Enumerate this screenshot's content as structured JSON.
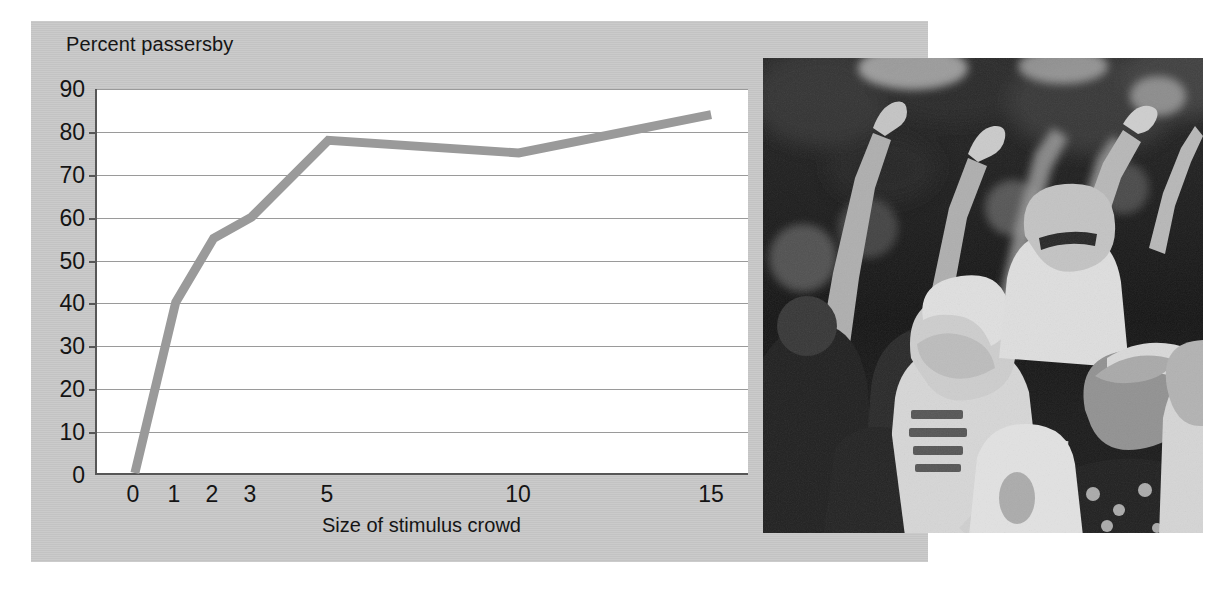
{
  "figure": {
    "panel_color": "#c9c9c9",
    "plot_background": "#ffffff",
    "line_color": "#9a9a9a",
    "axis_color": "#575757",
    "grid_color": "#9a9a9a"
  },
  "chart_data": {
    "type": "line",
    "title": "",
    "xlabel": "Size of stimulus crowd",
    "ylabel": "Percent passersby",
    "categories": [
      "0",
      "1",
      "2",
      "3",
      "5",
      "10",
      "15"
    ],
    "x": [
      0,
      1,
      2,
      3,
      5,
      10,
      15
    ],
    "values": [
      0,
      40,
      55,
      60,
      78,
      75,
      84
    ],
    "series": [
      {
        "name": "Percent passersby",
        "values": [
          0,
          40,
          55,
          60,
          78,
          75,
          84
        ]
      }
    ],
    "xtick_labels": [
      "0",
      "1",
      "2",
      "3",
      "5",
      "10",
      "15"
    ],
    "ytick_labels": [
      "0",
      "10",
      "20",
      "30",
      "40",
      "50",
      "60",
      "70",
      "80",
      "90"
    ],
    "yticks": [
      0,
      10,
      20,
      30,
      40,
      50,
      60,
      70,
      80,
      90
    ],
    "ylim": [
      0,
      90
    ],
    "grid": "horizontal",
    "legend": "none",
    "line_color": "#9a9a9a"
  },
  "photo": {
    "caption": "",
    "alt_name": "crowd-looking-up-photograph"
  }
}
